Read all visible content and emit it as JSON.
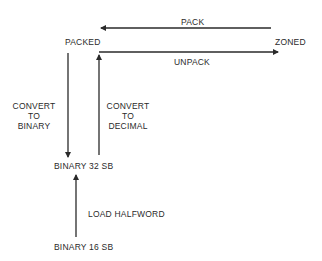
{
  "diagram": {
    "nodes": {
      "packed": "PACKED",
      "zoned": "ZONED",
      "binary32": "BINARY 32 SB",
      "binary16": "BINARY 16 SB"
    },
    "edges": {
      "pack": {
        "label": "PACK",
        "from": "ZONED",
        "to": "PACKED"
      },
      "unpack": {
        "label": "UNPACK",
        "from": "PACKED",
        "to": "ZONED"
      },
      "to_binary": {
        "label_lines": [
          "CONVERT",
          "TO",
          "BINARY"
        ],
        "from": "PACKED",
        "to": "BINARY 32 SB"
      },
      "to_decimal": {
        "label_lines": [
          "CONVERT",
          "TO",
          "DECIMAL"
        ],
        "from": "BINARY 32 SB",
        "to": "PACKED"
      },
      "load_halfword": {
        "label": "LOAD HALFWORD",
        "from": "BINARY 16 SB",
        "to": "BINARY 32 SB"
      }
    },
    "colors": {
      "line": "#2a2a2a",
      "text": "#2a2a2a",
      "background": "#ffffff"
    }
  }
}
